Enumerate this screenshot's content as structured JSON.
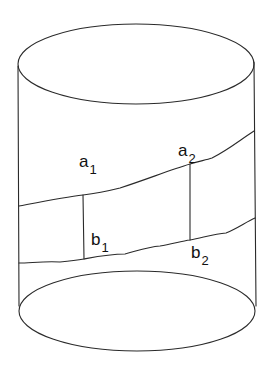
{
  "diagram": {
    "type": "cylinder-with-curves",
    "colors": {
      "background": "#ffffff",
      "stroke": "#2a2a2a",
      "text": "#111111"
    },
    "labels": [
      {
        "id": "a1",
        "base": "a",
        "sub": "1"
      },
      {
        "id": "a2",
        "base": "a",
        "sub": "2"
      },
      {
        "id": "b1",
        "base": "b",
        "sub": "1"
      },
      {
        "id": "b2",
        "base": "b",
        "sub": "2"
      }
    ]
  }
}
